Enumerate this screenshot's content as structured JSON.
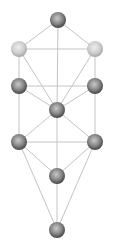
{
  "diagram": {
    "colors": {
      "edge": "#c4c4c4",
      "dark_node_inner": "#b0b0b0",
      "dark_node_outer": "#4a4a4a",
      "light_node_inner": "#e8e8e8",
      "light_node_outer": "#a8a8a8"
    },
    "nodes": [
      {
        "id": "n1",
        "x": 58,
        "y": 20,
        "r": 8,
        "tone": "dark"
      },
      {
        "id": "n2",
        "x": 95,
        "y": 49,
        "r": 8,
        "tone": "light"
      },
      {
        "id": "n3",
        "x": 19,
        "y": 49,
        "r": 8,
        "tone": "light"
      },
      {
        "id": "n4",
        "x": 95,
        "y": 86,
        "r": 8,
        "tone": "dark"
      },
      {
        "id": "n5",
        "x": 19,
        "y": 86,
        "r": 8,
        "tone": "dark"
      },
      {
        "id": "n6",
        "x": 57,
        "y": 110,
        "r": 8,
        "tone": "dark"
      },
      {
        "id": "n7",
        "x": 95,
        "y": 142,
        "r": 8,
        "tone": "dark"
      },
      {
        "id": "n8",
        "x": 19,
        "y": 142,
        "r": 8,
        "tone": "dark"
      },
      {
        "id": "n9",
        "x": 57,
        "y": 176,
        "r": 8,
        "tone": "dark"
      },
      {
        "id": "n10",
        "x": 57,
        "y": 230,
        "r": 8,
        "tone": "dark"
      }
    ],
    "edges": [
      [
        "n1",
        "n2"
      ],
      [
        "n1",
        "n3"
      ],
      [
        "n1",
        "n6"
      ],
      [
        "n2",
        "n3"
      ],
      [
        "n2",
        "n4"
      ],
      [
        "n3",
        "n5"
      ],
      [
        "n2",
        "n6"
      ],
      [
        "n3",
        "n6"
      ],
      [
        "n4",
        "n5"
      ],
      [
        "n4",
        "n6"
      ],
      [
        "n5",
        "n6"
      ],
      [
        "n4",
        "n7"
      ],
      [
        "n5",
        "n8"
      ],
      [
        "n6",
        "n7"
      ],
      [
        "n6",
        "n8"
      ],
      [
        "n6",
        "n9"
      ],
      [
        "n7",
        "n8"
      ],
      [
        "n7",
        "n9"
      ],
      [
        "n8",
        "n9"
      ],
      [
        "n7",
        "n10"
      ],
      [
        "n8",
        "n10"
      ],
      [
        "n9",
        "n10"
      ]
    ]
  }
}
